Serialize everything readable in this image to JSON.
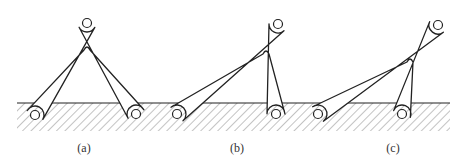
{
  "diagram": {
    "type": "linkage-mechanism-figure",
    "colors": {
      "stroke": "#222222",
      "hatch": "#888888",
      "background": "#ffffff"
    },
    "ground": {
      "y": 103,
      "x_start": 17,
      "x_end": 450,
      "hatch_depth": 28
    },
    "panels": [
      {
        "label": "(a)",
        "label_x": 84,
        "pivots": {
          "left": [
            35,
            115
          ],
          "top": [
            87,
            23
          ],
          "right": [
            136,
            114
          ]
        },
        "inner_apex": [
          87,
          46
        ]
      },
      {
        "label": "(b)",
        "label_x": 237,
        "pivots": {
          "left": [
            177,
            114
          ],
          "top": [
            278,
            24
          ],
          "right": [
            276,
            114
          ]
        },
        "inner_apex": [
          266,
          50
        ]
      },
      {
        "label": "(c)",
        "label_x": 393,
        "pivots": {
          "left": [
            318,
            114
          ],
          "top": [
            438,
            25
          ],
          "right": [
            402,
            114
          ]
        },
        "inner_apex": [
          410,
          58
        ]
      }
    ]
  }
}
